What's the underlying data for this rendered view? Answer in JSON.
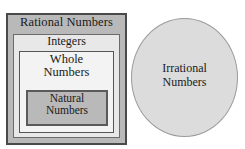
{
  "diagram": {
    "sets": {
      "rational": {
        "label": "Rational Numbers",
        "fill": "#b9b9b9",
        "stroke": "#4a4a4a",
        "shape": "rectangle"
      },
      "integers": {
        "label": "Integers",
        "fill": "#e8e8e8",
        "stroke": "#6b6b6b",
        "shape": "rectangle"
      },
      "whole": {
        "label": "Whole\nNumbers",
        "fill": "#f3f3f3",
        "stroke": "#555555",
        "shape": "rectangle"
      },
      "natural": {
        "label": "Natural\nNumbers",
        "fill": "#b9b9b9",
        "stroke": "#5a5a5a",
        "shape": "rectangle"
      },
      "irrational": {
        "label": "Irrational\nNumbers",
        "fill": "#dcdcdc",
        "stroke": "#9a9a9a",
        "shape": "circle"
      }
    },
    "background": "#ffffff"
  }
}
